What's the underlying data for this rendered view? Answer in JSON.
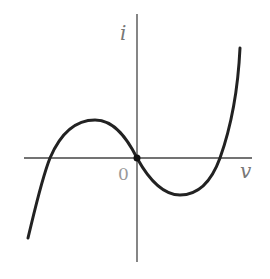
{
  "diagram": {
    "type": "i-v characteristic curve",
    "y_axis_label": "i",
    "x_axis_label": "v",
    "origin_label": "0",
    "curve_shape": "cubic (N-shaped), passing through origin with negative slope",
    "colors": {
      "curve": "#222222",
      "axes": "#444444",
      "labels": "#777777"
    }
  }
}
